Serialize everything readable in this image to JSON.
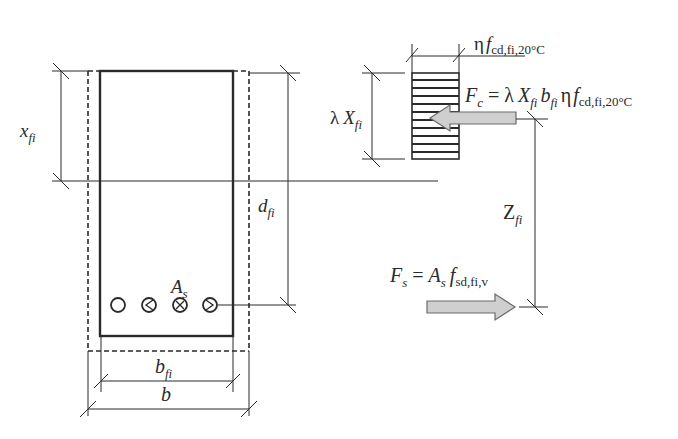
{
  "diagram": {
    "type": "reinforced-concrete-section-fire-design",
    "section": {
      "width_label": "b",
      "reduced_width_label": "b",
      "reduced_width_sub": "fi",
      "depth_label": "x",
      "depth_sub": "fi",
      "effective_depth_label": "d",
      "effective_depth_sub": "fi",
      "rebar_label": "A",
      "rebar_sub": "s",
      "rebar_count": 4
    },
    "stress_block": {
      "height_label_prefix": "λ",
      "height_label": "X",
      "height_sub": "fi",
      "stress_label_prefix": "η",
      "stress_label": "f",
      "stress_sub": "cd,fi,20°C"
    },
    "forces": {
      "compression": {
        "lhs": "F",
        "lhs_sub": "c",
        "eq": "=",
        "lambda": "λ",
        "X": "X",
        "X_sub": "fi",
        "b": "b",
        "b_sub": "fi",
        "eta": "η",
        "f": "f",
        "f_sub": "cd,fi,20°C"
      },
      "tension": {
        "lhs": "F",
        "lhs_sub": "s",
        "eq": "=",
        "A": "A",
        "A_sub": "s",
        "f": "f",
        "f_sub": "sd,fi,v"
      },
      "lever_arm_label": "Z",
      "lever_arm_sub": "fi"
    },
    "colors": {
      "line": "#2a2a2a",
      "arrow_fill": "#cfcfcf",
      "arrow_stroke": "#6a6a6a"
    }
  }
}
